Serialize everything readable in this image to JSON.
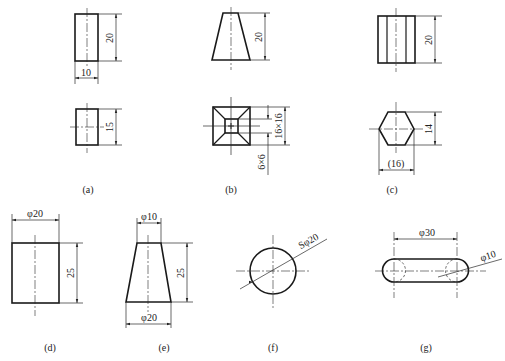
{
  "figure": {
    "colors": {
      "line": "#1a1a1a",
      "background": "#ffffff"
    }
  },
  "views": {
    "a": {
      "caption": "(a)",
      "front": {
        "height_dim": "20",
        "width_dim": "10"
      },
      "top": {
        "height_dim": "15"
      }
    },
    "b": {
      "caption": "(b)",
      "front": {
        "height_dim": "20"
      },
      "top": {
        "outer_dim": "16×16",
        "inner_dim": "6×6"
      }
    },
    "c": {
      "caption": "(c)",
      "front": {
        "height_dim": "20"
      },
      "top": {
        "height_dim": "14",
        "width_dim": "(16)"
      }
    },
    "d": {
      "caption": "(d)",
      "diameter_dim": "φ20",
      "height_dim": "25"
    },
    "e": {
      "caption": "(e)",
      "top_diameter_dim": "φ10",
      "bottom_diameter_dim": "φ20",
      "height_dim": "25"
    },
    "f": {
      "caption": "(f)",
      "sphere_dim": "Sφ20"
    },
    "g": {
      "caption": "(g)",
      "length_dim": "φ30",
      "end_diameter_dim": "φ10"
    }
  }
}
